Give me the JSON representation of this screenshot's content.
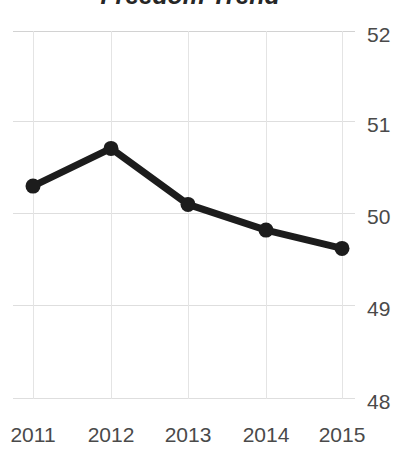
{
  "chart_data": {
    "type": "line",
    "title": "Freedom Trend",
    "xlabel": "",
    "ylabel": "",
    "categories": [
      "2011",
      "2012",
      "2013",
      "2014",
      "2015"
    ],
    "x": [
      2011,
      2012,
      2013,
      2014,
      2015
    ],
    "values": [
      50.31,
      50.72,
      50.11,
      49.83,
      49.63
    ],
    "series": [
      {
        "name": "Freedom",
        "values": [
          50.31,
          50.72,
          50.11,
          49.83,
          49.63
        ]
      }
    ],
    "ylim": [
      48,
      52
    ],
    "yticks": [
      52,
      51,
      50,
      49,
      48
    ],
    "ytick_labels": [
      "52",
      "51",
      "50",
      "49",
      "48"
    ],
    "xtick_labels": [
      "2011",
      "2012",
      "2013",
      "2014",
      "2015"
    ],
    "y_axis_position": "right",
    "grid": "both",
    "legend": "none",
    "line_color": "#1c1c1c",
    "marker_color": "#1c1c1c",
    "marker_shape": "circle",
    "grid_color": "#dedede",
    "tick_label_color": "#4a4a4a",
    "title_color": "#262626",
    "background_color": "#ffffff"
  }
}
